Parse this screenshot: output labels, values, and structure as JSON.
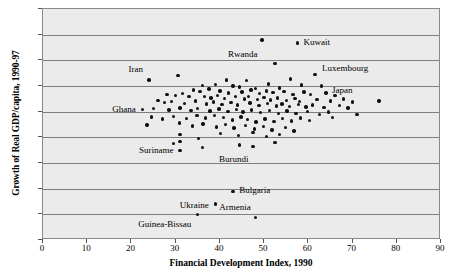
{
  "chart_data": {
    "type": "scatter",
    "title": "",
    "xlabel": "Financial Development Index, 1990",
    "ylabel": "Growth of Real GDP/capita, 1990-97",
    "xlim": [
      0,
      90
    ],
    "ylim": [
      -25,
      20
    ],
    "grid": true,
    "legend": "none",
    "xticks": [
      "0",
      "10",
      "20",
      "30",
      "40",
      "50",
      "60",
      "70",
      "80",
      "90"
    ],
    "yticks": [
      "20%",
      "15%",
      "10%",
      "5%",
      "0%",
      "-5%",
      "-10%",
      "-15%",
      "-20%",
      "-25%"
    ],
    "annotations": [
      {
        "label": "Rwanda",
        "x": 49.5,
        "y": 14.0,
        "dx": -1,
        "dy": -2.9
      },
      {
        "label": "Kuwait",
        "x": 57.5,
        "y": 13.4,
        "dx": 1.4,
        "dy": 0.0
      },
      {
        "label": "Iran",
        "x": 24.0,
        "y": 6.2,
        "dx": -1.4,
        "dy": 1.9
      },
      {
        "label": "Luxembourg",
        "x": 61.5,
        "y": 7.3,
        "dx": 1.6,
        "dy": 1.0
      },
      {
        "label": "Japan",
        "x": 76.0,
        "y": 2.1,
        "dx": -6.0,
        "dy": 1.9
      },
      {
        "label": "Ghana",
        "x": 22.5,
        "y": 0.4,
        "dx": -1.5,
        "dy": 0.0
      },
      {
        "label": "Suriname",
        "x": 31.0,
        "y": -7.6,
        "dx": -1.5,
        "dy": 0.0
      },
      {
        "label": "Burundi",
        "x": 47.5,
        "y": -6.8,
        "dx": -1.0,
        "dy": -2.6
      },
      {
        "label": "Bulgaria",
        "x": 43.0,
        "y": -15.5,
        "dx": 1.4,
        "dy": 0.0
      },
      {
        "label": "Ukraine",
        "x": 39.0,
        "y": -18.0,
        "dx": -1.5,
        "dy": -0.4
      },
      {
        "label": "Armenia",
        "x": 48.0,
        "y": -20.6,
        "dx": -1.0,
        "dy": 1.9
      },
      {
        "label": "Guinea-Bissau",
        "x": 35.0,
        "y": -20.0,
        "dx": -1.5,
        "dy": -2.0
      }
    ],
    "points": [
      {
        "x": 49.5,
        "y": 14.0
      },
      {
        "x": 57.5,
        "y": 13.4
      },
      {
        "x": 52.5,
        "y": 9.4
      },
      {
        "x": 24.0,
        "y": 6.2
      },
      {
        "x": 61.5,
        "y": 7.3
      },
      {
        "x": 76.0,
        "y": 2.1
      },
      {
        "x": 30.5,
        "y": 7.0
      },
      {
        "x": 41.5,
        "y": 6.2
      },
      {
        "x": 46.0,
        "y": 6.1
      },
      {
        "x": 56.0,
        "y": 6.4
      },
      {
        "x": 58.5,
        "y": 5.2
      },
      {
        "x": 63.0,
        "y": 5.0
      },
      {
        "x": 36.0,
        "y": 5.1
      },
      {
        "x": 39.0,
        "y": 5.3
      },
      {
        "x": 43.0,
        "y": 5.0
      },
      {
        "x": 44.5,
        "y": 4.8
      },
      {
        "x": 48.0,
        "y": 4.5
      },
      {
        "x": 51.0,
        "y": 5.4
      },
      {
        "x": 53.5,
        "y": 4.6
      },
      {
        "x": 34.0,
        "y": 4.2
      },
      {
        "x": 35.5,
        "y": 3.9
      },
      {
        "x": 37.5,
        "y": 4.4
      },
      {
        "x": 40.0,
        "y": 4.0
      },
      {
        "x": 42.0,
        "y": 3.6
      },
      {
        "x": 45.0,
        "y": 3.8
      },
      {
        "x": 47.0,
        "y": 4.2
      },
      {
        "x": 49.0,
        "y": 3.5
      },
      {
        "x": 50.5,
        "y": 4.0
      },
      {
        "x": 52.0,
        "y": 3.7
      },
      {
        "x": 54.5,
        "y": 3.9
      },
      {
        "x": 56.5,
        "y": 3.4
      },
      {
        "x": 59.0,
        "y": 3.8
      },
      {
        "x": 60.5,
        "y": 3.3
      },
      {
        "x": 64.0,
        "y": 3.6
      },
      {
        "x": 66.0,
        "y": 3.1
      },
      {
        "x": 28.0,
        "y": 3.4
      },
      {
        "x": 30.0,
        "y": 3.2
      },
      {
        "x": 31.5,
        "y": 3.5
      },
      {
        "x": 33.0,
        "y": 2.9
      },
      {
        "x": 36.5,
        "y": 3.0
      },
      {
        "x": 38.0,
        "y": 2.7
      },
      {
        "x": 39.5,
        "y": 3.1
      },
      {
        "x": 41.0,
        "y": 2.6
      },
      {
        "x": 43.5,
        "y": 2.9
      },
      {
        "x": 45.5,
        "y": 2.5
      },
      {
        "x": 46.5,
        "y": 3.0
      },
      {
        "x": 48.5,
        "y": 2.4
      },
      {
        "x": 50.0,
        "y": 2.8
      },
      {
        "x": 51.5,
        "y": 2.3
      },
      {
        "x": 53.0,
        "y": 2.7
      },
      {
        "x": 55.0,
        "y": 2.2
      },
      {
        "x": 57.0,
        "y": 2.6
      },
      {
        "x": 58.0,
        "y": 2.0
      },
      {
        "x": 62.0,
        "y": 2.4
      },
      {
        "x": 65.0,
        "y": 2.1
      },
      {
        "x": 68.0,
        "y": 2.5
      },
      {
        "x": 70.0,
        "y": 1.9
      },
      {
        "x": 26.0,
        "y": 2.2
      },
      {
        "x": 27.5,
        "y": 1.8
      },
      {
        "x": 29.0,
        "y": 2.0
      },
      {
        "x": 32.0,
        "y": 1.6
      },
      {
        "x": 34.5,
        "y": 2.1
      },
      {
        "x": 37.0,
        "y": 1.5
      },
      {
        "x": 38.5,
        "y": 1.9
      },
      {
        "x": 40.5,
        "y": 1.4
      },
      {
        "x": 42.5,
        "y": 1.8
      },
      {
        "x": 44.0,
        "y": 1.3
      },
      {
        "x": 46.8,
        "y": 1.7
      },
      {
        "x": 48.8,
        "y": 1.2
      },
      {
        "x": 50.8,
        "y": 1.6
      },
      {
        "x": 52.8,
        "y": 1.1
      },
      {
        "x": 54.0,
        "y": 1.5
      },
      {
        "x": 55.8,
        "y": 1.0
      },
      {
        "x": 57.8,
        "y": 1.4
      },
      {
        "x": 59.5,
        "y": 0.9
      },
      {
        "x": 61.0,
        "y": 1.3
      },
      {
        "x": 63.5,
        "y": 0.8
      },
      {
        "x": 67.0,
        "y": 1.2
      },
      {
        "x": 69.0,
        "y": 0.7
      },
      {
        "x": 22.5,
        "y": 0.4
      },
      {
        "x": 25.0,
        "y": 0.6
      },
      {
        "x": 28.5,
        "y": 0.3
      },
      {
        "x": 31.0,
        "y": 0.7
      },
      {
        "x": 33.5,
        "y": 0.2
      },
      {
        "x": 35.0,
        "y": 0.6
      },
      {
        "x": 37.8,
        "y": 0.1
      },
      {
        "x": 39.8,
        "y": 0.5
      },
      {
        "x": 41.8,
        "y": 0.0
      },
      {
        "x": 43.8,
        "y": 0.4
      },
      {
        "x": 45.2,
        "y": -0.1
      },
      {
        "x": 47.2,
        "y": 0.3
      },
      {
        "x": 49.2,
        "y": -0.2
      },
      {
        "x": 51.2,
        "y": 0.2
      },
      {
        "x": 53.2,
        "y": -0.3
      },
      {
        "x": 55.2,
        "y": 0.1
      },
      {
        "x": 57.2,
        "y": -0.4
      },
      {
        "x": 59.8,
        "y": 0.0
      },
      {
        "x": 62.5,
        "y": -0.5
      },
      {
        "x": 64.5,
        "y": -0.1
      },
      {
        "x": 71.0,
        "y": -0.6
      },
      {
        "x": 24.5,
        "y": -1.0
      },
      {
        "x": 27.0,
        "y": -1.4
      },
      {
        "x": 29.5,
        "y": -0.9
      },
      {
        "x": 32.5,
        "y": -1.3
      },
      {
        "x": 34.8,
        "y": -0.8
      },
      {
        "x": 36.8,
        "y": -1.2
      },
      {
        "x": 38.8,
        "y": -0.7
      },
      {
        "x": 40.8,
        "y": -1.1
      },
      {
        "x": 42.8,
        "y": -1.6
      },
      {
        "x": 44.8,
        "y": -1.0
      },
      {
        "x": 46.2,
        "y": -1.5
      },
      {
        "x": 48.2,
        "y": -2.0
      },
      {
        "x": 50.2,
        "y": -1.4
      },
      {
        "x": 52.2,
        "y": -1.9
      },
      {
        "x": 54.2,
        "y": -1.3
      },
      {
        "x": 56.2,
        "y": -1.8
      },
      {
        "x": 58.2,
        "y": -1.2
      },
      {
        "x": 60.2,
        "y": -1.7
      },
      {
        "x": 65.5,
        "y": -1.1
      },
      {
        "x": 23.5,
        "y": -2.6
      },
      {
        "x": 30.8,
        "y": -2.2
      },
      {
        "x": 33.8,
        "y": -2.8
      },
      {
        "x": 36.2,
        "y": -2.4
      },
      {
        "x": 39.2,
        "y": -3.0
      },
      {
        "x": 41.2,
        "y": -2.5
      },
      {
        "x": 43.2,
        "y": -3.2
      },
      {
        "x": 45.8,
        "y": -2.7
      },
      {
        "x": 47.8,
        "y": -3.4
      },
      {
        "x": 49.8,
        "y": -2.9
      },
      {
        "x": 51.8,
        "y": -3.6
      },
      {
        "x": 54.8,
        "y": -3.1
      },
      {
        "x": 56.8,
        "y": -3.8
      },
      {
        "x": 40.2,
        "y": -4.2
      },
      {
        "x": 44.2,
        "y": -4.6
      },
      {
        "x": 47.5,
        "y": -4.0
      },
      {
        "x": 50.5,
        "y": -4.8
      },
      {
        "x": 53.5,
        "y": -4.4
      },
      {
        "x": 31.0,
        "y": -4.5
      },
      {
        "x": 35.2,
        "y": -5.2
      },
      {
        "x": 31.0,
        "y": -5.8
      },
      {
        "x": 31.0,
        "y": -7.6
      },
      {
        "x": 47.5,
        "y": -6.8
      },
      {
        "x": 36.0,
        "y": -7.0
      },
      {
        "x": 43.0,
        "y": -15.5
      },
      {
        "x": 39.0,
        "y": -18.0
      },
      {
        "x": 48.0,
        "y": -20.6
      },
      {
        "x": 35.0,
        "y": -20.0
      },
      {
        "x": 29.5,
        "y": -6.2
      },
      {
        "x": 52.5,
        "y": -6.0
      },
      {
        "x": 44.5,
        "y": -6.5
      }
    ]
  }
}
